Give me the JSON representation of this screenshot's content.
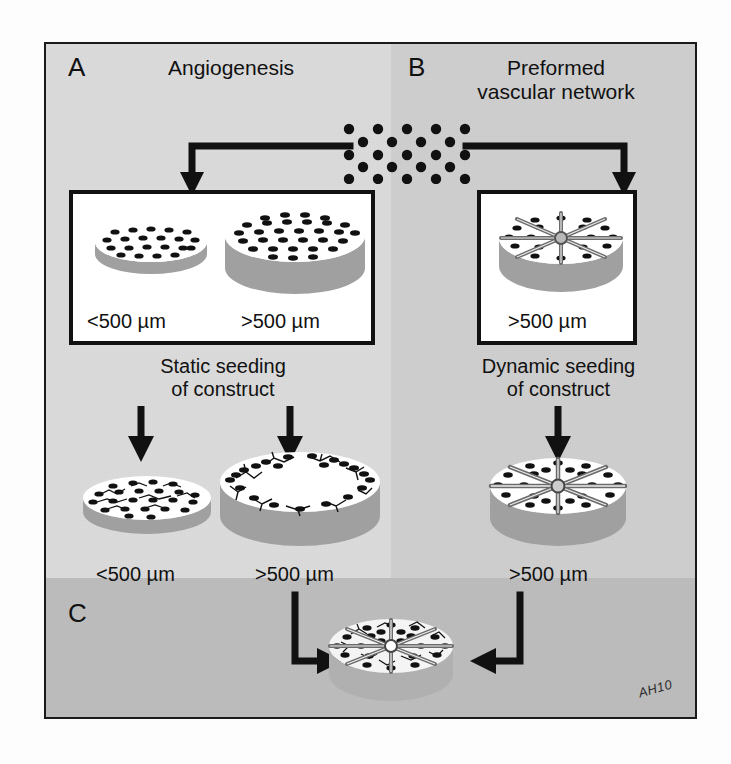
{
  "figure": {
    "title_signature": "AH10",
    "colors": {
      "bg_left": "#dcdcdc",
      "bg_right": "#cfcfcf",
      "bg_bottom": "#bdbdbd",
      "ink": "#111111",
      "scaffold_side": "#9e9e9e",
      "scaffold_top": "#ffffff",
      "vessel_gray": "#8a8a8a"
    }
  },
  "panels": {
    "a": {
      "letter": "A",
      "heading": "Angiogenesis",
      "box_label_small": "<500 µm",
      "box_label_large": ">500 µm",
      "seeding_line1": "Static seeding",
      "seeding_line2": "of construct",
      "result_label_small": "<500 µm",
      "result_label_large": ">500 µm"
    },
    "b": {
      "letter": "B",
      "heading_line1": "Preformed",
      "heading_line2": "vascular network",
      "box_label": ">500 µm",
      "seeding_line1": "Dynamic seeding",
      "seeding_line2": "of construct",
      "result_label": ">500 µm"
    },
    "c": {
      "letter": "C"
    }
  },
  "cell_cluster": {
    "name": "endothelial-cell-suspension",
    "rows": 5,
    "cols": 5,
    "dot_count": 25
  },
  "diagram_data": {
    "type": "flow-diagram",
    "description": "Two strategies for vascularizing tissue-engineered constructs: (A) angiogenesis after static seeding, (B) preformed vascular network after dynamic seeding, (C) combined approach.",
    "nodes": [
      {
        "id": "cells",
        "label": "Cell suspension",
        "panel": "top"
      },
      {
        "id": "a-small",
        "label": "<500 µm scaffold",
        "panel": "A"
      },
      {
        "id": "a-large",
        "label": ">500 µm scaffold",
        "panel": "A"
      },
      {
        "id": "b-large",
        "label": ">500 µm scaffold with channels",
        "panel": "B"
      },
      {
        "id": "a-small-result",
        "label": "<500 µm seeded construct",
        "panel": "A"
      },
      {
        "id": "a-large-result",
        "label": ">500 µm construct with necrotic core",
        "panel": "A"
      },
      {
        "id": "b-large-result",
        "label": ">500 µm construct with perfused network",
        "panel": "B"
      },
      {
        "id": "c-result",
        "label": "Combined vascularized construct",
        "panel": "C"
      }
    ],
    "edges": [
      {
        "from": "cells",
        "to": "a-small",
        "style": "elbow-left"
      },
      {
        "from": "cells",
        "to": "b-large",
        "style": "elbow-right"
      },
      {
        "from": "a-small",
        "to": "a-small-result",
        "style": "down"
      },
      {
        "from": "a-large",
        "to": "a-large-result",
        "style": "down"
      },
      {
        "from": "b-large",
        "to": "b-large-result",
        "style": "down"
      },
      {
        "from": "a-large-result",
        "to": "c-result",
        "style": "elbow-down-right"
      },
      {
        "from": "b-large-result",
        "to": "c-result",
        "style": "elbow-down-left"
      }
    ]
  }
}
